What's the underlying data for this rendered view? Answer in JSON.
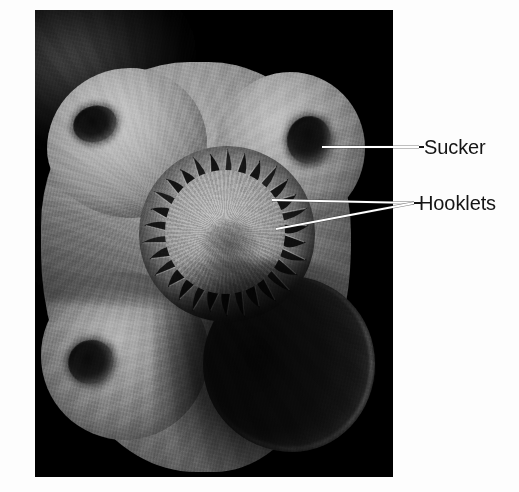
{
  "figure": {
    "type": "scanning-electron-micrograph",
    "background_color": "#fdfdfd",
    "plate_background_color": "#000000"
  },
  "labels": [
    {
      "id": "sucker",
      "text": "Sucker",
      "color": "#151515",
      "leader": {
        "style": "straight",
        "stroke": "#ffffff",
        "from": {
          "x": 322,
          "y": 147
        },
        "to": {
          "x": 419,
          "y": 147
        }
      }
    },
    {
      "id": "hooklets",
      "text": "Hooklets",
      "color": "#151515",
      "leader": {
        "style": "forked",
        "stroke": "#ffffff",
        "junction": {
          "x": 414,
          "y": 203
        },
        "branches": [
          {
            "from": {
              "x": 272,
              "y": 200
            },
            "to": {
              "x": 414,
              "y": 203
            }
          },
          {
            "from": {
              "x": 276,
              "y": 229
            },
            "to": {
              "x": 414,
              "y": 203
            }
          }
        ]
      }
    }
  ],
  "anatomy": {
    "rostellum": {
      "name": "rostellum",
      "hooklet_count": 30,
      "center": {
        "x": 192,
        "y": 224
      },
      "outer_radius": 88,
      "inner_radius": 52
    },
    "suckers": [
      {
        "name": "sucker-upper-left",
        "center": {
          "x": 95,
          "y": 124
        }
      },
      {
        "name": "sucker-upper-right",
        "center": {
          "x": 309,
          "y": 140
        }
      },
      {
        "name": "sucker-lower-left",
        "center": {
          "x": 91,
          "y": 362
        }
      },
      {
        "name": "sucker-lower-right",
        "center": {
          "x": 289,
          "y": 364
        }
      }
    ]
  },
  "plate": {
    "left": 35,
    "top": 10,
    "width": 358,
    "height": 467
  }
}
